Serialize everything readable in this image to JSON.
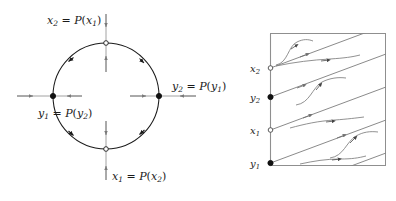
{
  "figure": {
    "background": "#ffffff",
    "stroke_dark": "#1b1b1b",
    "stroke_gray": "#7a7a7a",
    "marker_fill": "#111111",
    "marker_open_fill": "#ffffff"
  },
  "left_panel": {
    "name": "circle-phase-portrait",
    "circle": {
      "cx": 106,
      "cy": 96,
      "r": 53
    },
    "labels": {
      "top": {
        "lhs_var": "x",
        "lhs_sub": "2",
        "eq": "=",
        "map": "P",
        "arg_var": "x",
        "arg_sub": "1",
        "text": "x2 = P(x1)"
      },
      "bottom": {
        "lhs_var": "x",
        "lhs_sub": "1",
        "eq": "=",
        "map": "P",
        "arg_var": "x",
        "arg_sub": "2",
        "text": "x1 = P(x2)"
      },
      "left": {
        "lhs_var": "y",
        "lhs_sub": "1",
        "eq": "=",
        "map": "P",
        "arg_var": "y",
        "arg_sub": "2",
        "text": "y1 = P(y2)"
      },
      "right": {
        "lhs_var": "y",
        "lhs_sub": "2",
        "eq": "=",
        "map": "P",
        "arg_var": "y",
        "arg_sub": "1",
        "text": "y2 = P(y1)"
      }
    },
    "markers": [
      {
        "id": "top-point",
        "x": 106,
        "y": 43,
        "kind": "open"
      },
      {
        "id": "bottom-point",
        "x": 106,
        "y": 149,
        "kind": "open"
      },
      {
        "id": "left-point",
        "x": 53,
        "y": 96,
        "kind": "filled"
      },
      {
        "id": "right-point",
        "x": 159,
        "y": 96,
        "kind": "filled"
      }
    ],
    "transversal_arrows": [
      {
        "id": "top-incoming",
        "dir": "down"
      },
      {
        "id": "top-outgoing",
        "dir": "up"
      },
      {
        "id": "bottom-incoming",
        "dir": "down"
      },
      {
        "id": "bottom-outgoing",
        "dir": "up"
      },
      {
        "id": "left-incoming",
        "dir": "right"
      },
      {
        "id": "left-outgoing",
        "dir": "left"
      },
      {
        "id": "right-incoming",
        "dir": "right"
      },
      {
        "id": "right-outgoing",
        "dir": "left"
      }
    ],
    "flow_arrow_count": 4,
    "flow_direction": "counterclockwise"
  },
  "right_panel": {
    "name": "lift-flow-box",
    "box": {
      "x": 270,
      "y": 33,
      "width": 116,
      "height": 133
    },
    "axis_labels": [
      {
        "id": "x2",
        "var": "x",
        "sub": "2",
        "text": "x2",
        "y": 68,
        "marker": "open"
      },
      {
        "id": "y2",
        "var": "y",
        "sub": "2",
        "text": "y2",
        "y": 97,
        "marker": "filled"
      },
      {
        "id": "x1",
        "var": "x",
        "sub": "1",
        "text": "x1",
        "y": 130,
        "marker": "open"
      },
      {
        "id": "y1",
        "var": "y",
        "sub": "1",
        "text": "y1",
        "y": 163,
        "marker": "filled"
      }
    ],
    "diagonal_line_count": 4,
    "trajectory_count": 4
  }
}
